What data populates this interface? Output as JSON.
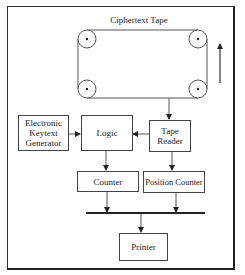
{
  "diagram": {
    "title": "Ciphertext Tape",
    "nodes": {
      "keytext_generator": {
        "label": "Electronic\nKeytext\nGenerator"
      },
      "logic": {
        "label": "Logic"
      },
      "tape_reader": {
        "label": "Tape\nReader"
      },
      "counter": {
        "label": "Counter"
      },
      "position_counter": {
        "label": "Position Counter"
      },
      "printer": {
        "label": "Printer"
      }
    },
    "tape": {
      "label": "Ciphertext Tape",
      "reels": 4,
      "direction": "up"
    },
    "edges": [
      {
        "from": "ciphertext_tape",
        "to": "tape_reader"
      },
      {
        "from": "keytext_generator",
        "to": "logic"
      },
      {
        "from": "tape_reader",
        "to": "logic"
      },
      {
        "from": "logic",
        "to": "counter"
      },
      {
        "from": "tape_reader",
        "to": "position_counter"
      },
      {
        "from": "counter",
        "to": "bus"
      },
      {
        "from": "position_counter",
        "to": "bus"
      },
      {
        "from": "bus",
        "to": "printer"
      }
    ],
    "colors": {
      "line": "#444444",
      "text": "#222222",
      "background": "#ffffff"
    }
  }
}
